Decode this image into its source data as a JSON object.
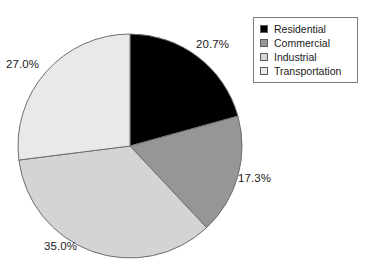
{
  "chart_data": {
    "type": "pie",
    "title": "",
    "legend_position": "top-right",
    "categories": [
      "Residential",
      "Commercial",
      "Industrial",
      "Transportation"
    ],
    "values": [
      20.7,
      17.3,
      35.0,
      27.0
    ],
    "value_labels": [
      "20.7%",
      "17.3%",
      "35.0%",
      "27.0%"
    ],
    "colors": [
      "#000000",
      "#969696",
      "#d4d4d4",
      "#e9e9e9"
    ],
    "start_angle_deg": 0,
    "direction": "clockwise",
    "slice_border_color": "#6e6e6e",
    "units": "percent"
  },
  "legend": {
    "items": [
      {
        "label": "Residential",
        "color": "#000000"
      },
      {
        "label": "Commercial",
        "color": "#969696"
      },
      {
        "label": "Industrial",
        "color": "#d4d4d4"
      },
      {
        "label": "Transportation",
        "color": "#e9e9e9"
      }
    ]
  },
  "labels": {
    "residential": "20.7%",
    "commercial": "17.3%",
    "industrial": "35.0%",
    "transportation": "27.0%"
  }
}
